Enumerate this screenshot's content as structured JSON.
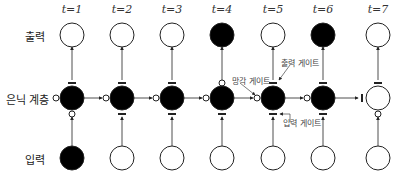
{
  "rows": {
    "output": "출력",
    "hidden": "은닉 계층",
    "input": "입력"
  },
  "timesteps": [
    {
      "label": "t=1",
      "x": 72,
      "input_filled": true,
      "hidden_filled": true,
      "output_filled": false,
      "input_gate": "open",
      "output_gate": "closed",
      "forget_gate_left": "open"
    },
    {
      "label": "t=2",
      "x": 122,
      "input_filled": false,
      "hidden_filled": true,
      "output_filled": false,
      "input_gate": "closed",
      "output_gate": "closed",
      "forget_gate_left": "open"
    },
    {
      "label": "t=3",
      "x": 172,
      "input_filled": false,
      "hidden_filled": true,
      "output_filled": false,
      "input_gate": "closed",
      "output_gate": "closed",
      "forget_gate_left": "open"
    },
    {
      "label": "t=4",
      "x": 222,
      "input_filled": false,
      "hidden_filled": true,
      "output_filled": true,
      "input_gate": "closed",
      "output_gate": "open",
      "forget_gate_left": "open"
    },
    {
      "label": "t=5",
      "x": 273,
      "input_filled": false,
      "hidden_filled": true,
      "output_filled": false,
      "input_gate": "closed",
      "output_gate": "closed",
      "forget_gate_left": "open"
    },
    {
      "label": "t=6",
      "x": 323,
      "input_filled": false,
      "hidden_filled": true,
      "output_filled": true,
      "input_gate": "closed",
      "output_gate": "closed",
      "forget_gate_left": "open"
    },
    {
      "label": "t=7",
      "x": 378,
      "input_filled": false,
      "hidden_filled": false,
      "output_filled": false,
      "input_gate": "open",
      "output_gate": "closed",
      "forget_gate_left": "closed"
    }
  ],
  "annotations": {
    "forget_gate": "망각 게이트",
    "output_gate": "출력 게이트",
    "input_gate": "입력 게이트"
  },
  "colors": {
    "filled": "#000000",
    "empty": "#ffffff",
    "stroke": "#222222"
  }
}
